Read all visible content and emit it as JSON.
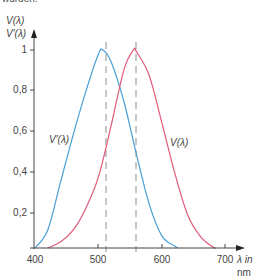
{
  "top_text": "wurden.",
  "chart_data": {
    "type": "line",
    "title": "",
    "ylabel_lines": [
      "V(λ)",
      "V′(λ)"
    ],
    "xlabel_lines": [
      "λ in",
      "nm"
    ],
    "xlim": [
      400,
      710
    ],
    "ylim": [
      0,
      1
    ],
    "x_ticks": [
      400,
      500,
      600,
      700
    ],
    "x_tick_labels": [
      "400",
      "500",
      "600",
      "700"
    ],
    "y_ticks": [
      0.2,
      0.4,
      0.6,
      0.8,
      1
    ],
    "y_tick_labels": [
      "0,2",
      "0,4",
      "0,6",
      "0,8",
      "1"
    ],
    "grid": false,
    "series": [
      {
        "name": "V′(λ)",
        "color": "#4a9fd8",
        "peak_x": 507,
        "x": [
          400,
          420,
          440,
          460,
          480,
          500,
          507,
          520,
          540,
          560,
          580,
          600,
          620,
          625
        ],
        "values": [
          0.0,
          0.09,
          0.33,
          0.57,
          0.79,
          0.98,
          1.0,
          0.94,
          0.74,
          0.47,
          0.22,
          0.06,
          0.01,
          0.0
        ]
      },
      {
        "name": "V(λ)",
        "color": "#e05a78",
        "peak_x": 555,
        "x": [
          420,
          440,
          460,
          480,
          500,
          520,
          540,
          555,
          560,
          580,
          600,
          620,
          640,
          660,
          680,
          685
        ],
        "values": [
          0.0,
          0.03,
          0.09,
          0.2,
          0.36,
          0.62,
          0.9,
          1.0,
          0.99,
          0.87,
          0.63,
          0.38,
          0.17,
          0.06,
          0.005,
          0.0
        ]
      }
    ],
    "annotations": [
      {
        "type": "vline",
        "x": 507,
        "style": "dashed",
        "color": "#aaaaaa"
      },
      {
        "type": "vline",
        "x": 555,
        "style": "dashed",
        "color": "#aaaaaa"
      },
      {
        "type": "label",
        "text": "V′(λ)",
        "near_series": "V′(λ)"
      },
      {
        "type": "label",
        "text": "V(λ)",
        "near_series": "V(λ)"
      }
    ]
  },
  "labels": {
    "y_title_1": "V(λ)",
    "y_title_2": "V′(λ)",
    "x_title_1": "λ in",
    "x_title_2": "nm",
    "curve_blue": "V′(λ)",
    "curve_red": "V(λ)",
    "xt0": "400",
    "xt1": "500",
    "xt2": "600",
    "xt3": "700",
    "yt1": "0,2",
    "yt2": "0,4",
    "yt3": "0,6",
    "yt4": "0,8",
    "yt5": "1"
  }
}
